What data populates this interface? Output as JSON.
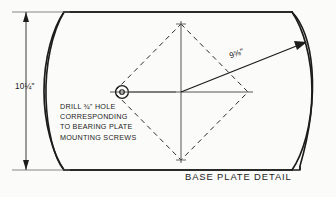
{
  "drawing": {
    "title": "BASE PLATE DETAIL",
    "type": "mechanical-detail-drawing",
    "background_color": "#fbfbf9",
    "line_color": "#1c1c1c",
    "dimensions": {
      "height_label": "10¼\"",
      "height_value": "10 1/4",
      "height_unit": "inch",
      "radius_label": "9⅝\"",
      "radius_value": "9 5/8",
      "radius_unit": "inch"
    },
    "note": {
      "lines": [
        "DRILL ¾\" HOLE",
        "CORRESPONDING",
        "TO BEARING PLATE",
        "MOUNTING SCREWS"
      ],
      "hole_size": "3/4",
      "hole_unit": "inch"
    },
    "features": {
      "plate_outline": "flat top and bottom edges with chamfered corners and convex curved left and right sides",
      "bolt_pattern": "dashed diamond (rhombus) bolt-hole pattern centered on plate",
      "centerlines": "solid horizontal and vertical centerlines through diamond center",
      "radius_leader": "solid line from center to upper-right with arrowhead at curved right edge",
      "drill_hole": "small circle with center dot left of plate center, joined by horizontal centerline"
    }
  }
}
